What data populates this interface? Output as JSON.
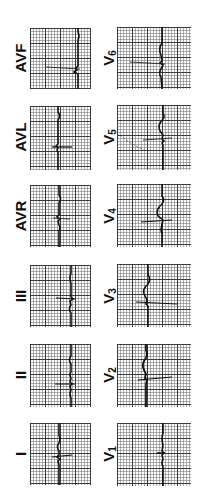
{
  "figure": {
    "orientation": "rotated 90° counter-clockwise",
    "grid_color": "#2a2a2a",
    "trace_color": "#111111"
  },
  "leads": [
    {
      "id": "avf",
      "label": "AVF",
      "sub": "",
      "column": "left",
      "row": 0
    },
    {
      "id": "v6",
      "label": "V",
      "sub": "6",
      "column": "right",
      "row": 0
    },
    {
      "id": "avl",
      "label": "AVL",
      "sub": "",
      "column": "left",
      "row": 1
    },
    {
      "id": "v5",
      "label": "V",
      "sub": "5",
      "column": "right",
      "row": 1
    },
    {
      "id": "avr",
      "label": "AVR",
      "sub": "",
      "column": "left",
      "row": 2
    },
    {
      "id": "v4",
      "label": "V",
      "sub": "4",
      "column": "right",
      "row": 2
    },
    {
      "id": "iii",
      "label": "III",
      "sub": "",
      "column": "left",
      "row": 3
    },
    {
      "id": "v3",
      "label": "V",
      "sub": "3",
      "column": "right",
      "row": 3
    },
    {
      "id": "ii",
      "label": "II",
      "sub": "",
      "column": "left",
      "row": 4
    },
    {
      "id": "v2",
      "label": "V",
      "sub": "2",
      "column": "right",
      "row": 4
    },
    {
      "id": "i",
      "label": "I",
      "sub": "",
      "column": "left",
      "row": 5
    },
    {
      "id": "v1",
      "label": "V",
      "sub": "1",
      "column": "right",
      "row": 5
    }
  ]
}
